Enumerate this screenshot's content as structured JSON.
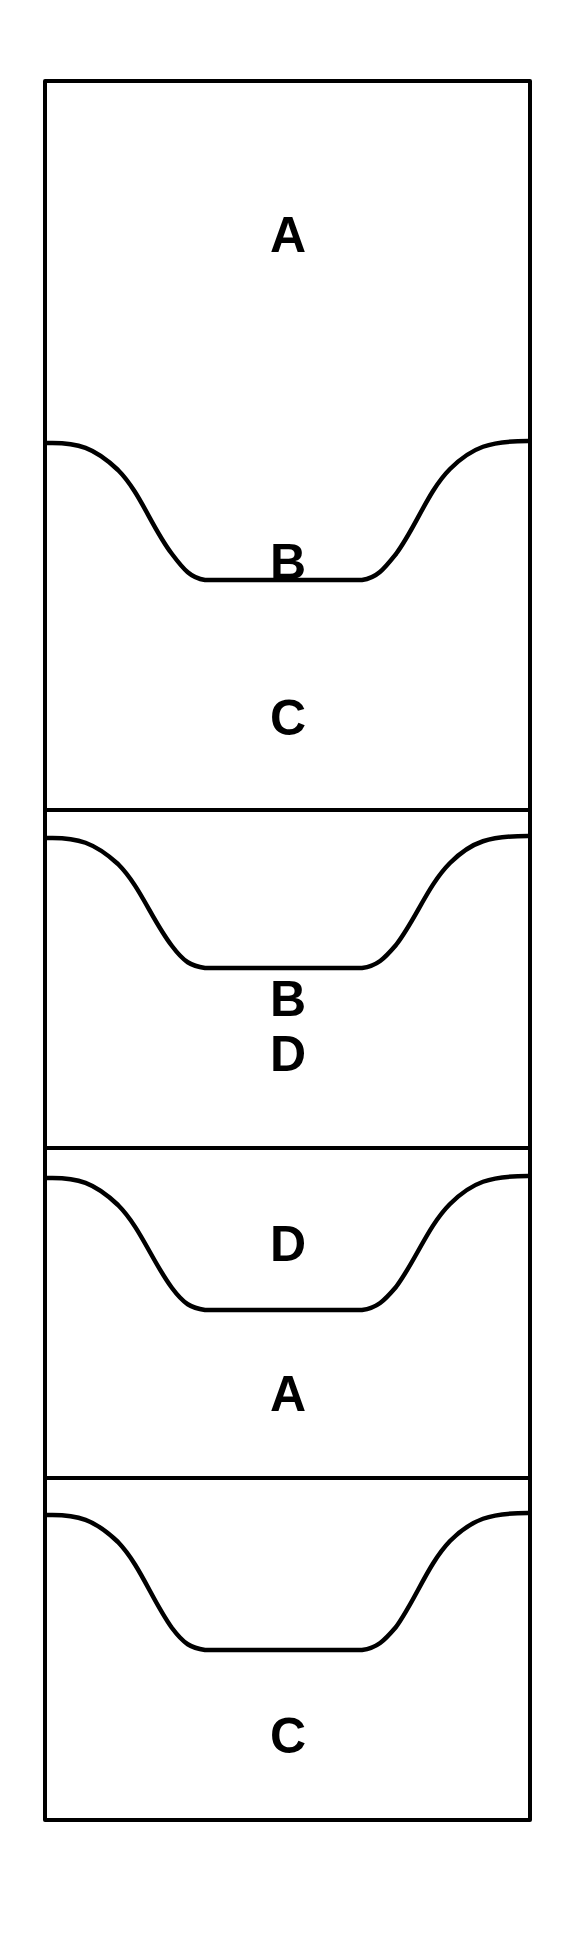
{
  "figure": {
    "name": "stratigraphic-column",
    "background_color": "#ffffff",
    "line_color": "#000000",
    "outer_box": {
      "x": 45,
      "y": 81,
      "width": 485,
      "height": 1739
    },
    "panels": [
      {
        "id": "panel-1",
        "top": 81,
        "bottom": 810,
        "scour": {
          "edge_y": 443,
          "trough_y": 580,
          "trough_left": 193,
          "trough_right": 373
        },
        "upper_label": "A",
        "upper_label_x": 288,
        "upper_label_y": 239,
        "lower_label": "B",
        "lower_label_x": 288,
        "lower_label_y": 566
      },
      {
        "id": "panel-2",
        "top": 810,
        "bottom": 1148,
        "scour": {
          "edge_y": 838,
          "trough_y": 968,
          "trough_left": 193,
          "trough_right": 373
        },
        "upper_label": "C",
        "upper_label_x": 288,
        "upper_label_y": 722,
        "lower_label": "D",
        "lower_label_x": 288,
        "lower_label_y": 1058
      },
      {
        "id": "panel-3",
        "top": 1148,
        "bottom": 1478,
        "scour": {
          "edge_y": 1178,
          "trough_y": 1310,
          "trough_left": 193,
          "trough_right": 373
        },
        "upper_label": "B",
        "upper_label_x": 288,
        "upper_label_y": 1003,
        "lower_label": "A",
        "lower_label_x": 288,
        "lower_label_y": 1398
      },
      {
        "id": "panel-4",
        "top": 1478,
        "bottom": 1820,
        "scour": {
          "edge_y": 1515,
          "trough_y": 1650,
          "trough_left": 193,
          "trough_right": 373
        },
        "upper_label": "D",
        "upper_label_x": 288,
        "upper_label_y": 1248,
        "lower_label": "C",
        "lower_label_x": 288,
        "lower_label_y": 1740
      }
    ],
    "labels_in_reading_order": [
      "A",
      "B",
      "C",
      "D",
      "B",
      "A",
      "D",
      "C"
    ],
    "dividers_y": [
      810,
      1148,
      1478
    ]
  }
}
